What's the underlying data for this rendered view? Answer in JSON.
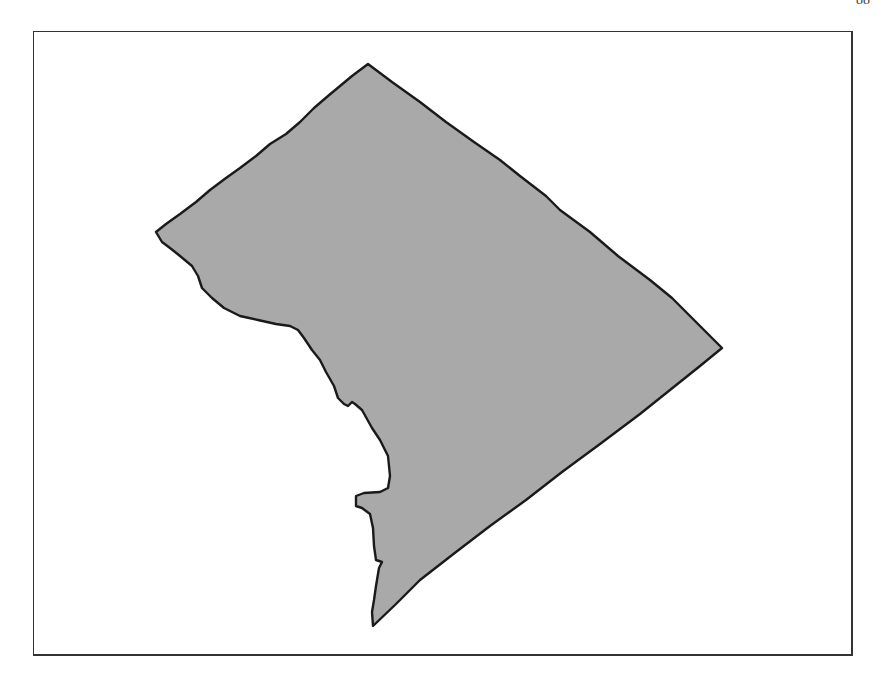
{
  "page": {
    "page_number_fragment": "88"
  },
  "map": {
    "subject": "District of Columbia outline",
    "fill_color": "#a9a9a9",
    "stroke_color": "#1a1a1a",
    "frame_color": "#333333",
    "labels": []
  }
}
